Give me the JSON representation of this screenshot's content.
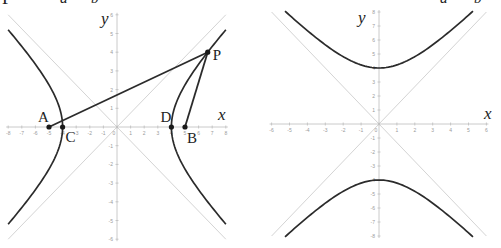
{
  "top_fragments": {
    "left": [
      {
        "text": "P",
        "x": 2,
        "y": -11,
        "size": 18,
        "italic": false
      },
      {
        "text": "a²",
        "x": 60,
        "y": -9,
        "size": 15,
        "italic": true
      },
      {
        "text": "b²",
        "x": 91,
        "y": -9,
        "size": 15,
        "italic": true
      }
    ],
    "right": [
      {
        "text": "a²",
        "x": 440,
        "y": -9,
        "size": 15,
        "italic": true
      },
      {
        "text": "b²",
        "x": 474,
        "y": -9,
        "size": 15,
        "italic": true
      }
    ]
  },
  "colors": {
    "curve": "#2b2b2b",
    "segment": "#2b2b2b",
    "axis": "#bdbdbd",
    "asymptote": "#d4d4d4",
    "tick_label": "#9a9a9a",
    "point": "#1a1a1a",
    "label": "#222222"
  },
  "chart_data": [
    {
      "type": "line",
      "title": "",
      "equation": "x^2/16 - y^2/9 = 1",
      "orientation": "horizontal-transverse",
      "a": 4,
      "b": 3,
      "c": 5,
      "xlabel": "x",
      "ylabel": "y",
      "xlim": [
        -8,
        8
      ],
      "ylim": [
        -6,
        6
      ],
      "x_ticks": [
        -8,
        -7,
        -6,
        -5,
        -4,
        -3,
        -2,
        -1,
        0,
        1,
        2,
        3,
        4,
        5,
        6,
        7,
        8
      ],
      "y_ticks": [
        -6,
        -5,
        -4,
        -3,
        -2,
        -1,
        1,
        2,
        3,
        4,
        5,
        6
      ],
      "asymptotes": [
        "y = 3/4 x",
        "y = -3/4 x"
      ],
      "points": [
        {
          "label": "A",
          "x": -5,
          "y": 0
        },
        {
          "label": "C",
          "x": -4,
          "y": 0
        },
        {
          "label": "D",
          "x": 4,
          "y": 0
        },
        {
          "label": "B",
          "x": 5,
          "y": 0
        },
        {
          "label": "P",
          "x": 6.67,
          "y": 4
        }
      ],
      "segments": [
        [
          "A",
          "P"
        ],
        [
          "B",
          "P"
        ]
      ],
      "grid": false
    },
    {
      "type": "line",
      "title": "",
      "equation": "y^2/16 - x^2/9 = 1",
      "orientation": "vertical-transverse",
      "a": 4,
      "b": 3,
      "xlabel": "x",
      "ylabel": "y",
      "xlim": [
        -6,
        6
      ],
      "ylim": [
        -8,
        8
      ],
      "x_ticks": [
        -6,
        -5,
        -4,
        -3,
        -2,
        -1,
        0,
        1,
        2,
        3,
        4,
        5,
        6
      ],
      "y_ticks": [
        -8,
        -7,
        -6,
        -5,
        -4,
        -3,
        -2,
        -1,
        1,
        2,
        3,
        4,
        5,
        6,
        7,
        8
      ],
      "asymptotes": [
        "y = 4/3 x",
        "y = -4/3 x"
      ],
      "points": [],
      "segments": [],
      "grid": false
    }
  ],
  "layout": {
    "left": {
      "ox": 117,
      "oy": 127,
      "sx": 13.6,
      "sy": 18.7,
      "x_label_pos": [
        218,
        120
      ],
      "y_label_pos": [
        101,
        24
      ],
      "curve_range": 5.2
    },
    "right": {
      "ox": 379,
      "oy": 124,
      "sx": 17.9,
      "sy": 14.0,
      "x_label_pos": [
        484,
        119
      ],
      "y_label_pos": [
        358,
        23
      ],
      "curve_range": 5.25
    },
    "point_label_offsets": {
      "A": [
        -11,
        -5
      ],
      "C": [
        3,
        15
      ],
      "D": [
        -11,
        -5
      ],
      "B": [
        2,
        16
      ],
      "P": [
        5,
        8
      ]
    }
  }
}
